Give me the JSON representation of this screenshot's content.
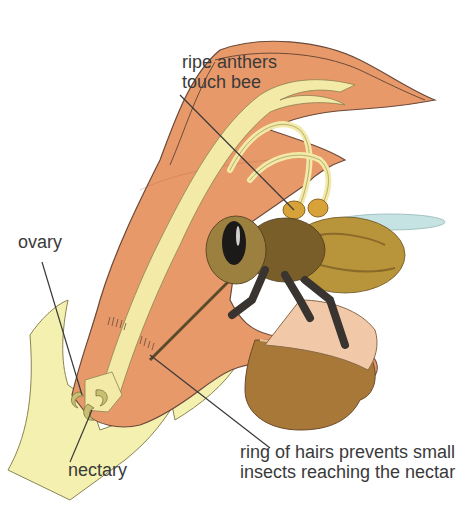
{
  "diagram": {
    "labels": {
      "anthers": {
        "line1": "ripe anthers",
        "line2": "touch bee"
      },
      "ovary": "ovary",
      "nectary": "nectary",
      "hairs": {
        "line1": "ring of hairs prevents small",
        "line2": "insects reaching the nectar"
      }
    },
    "colors": {
      "petal": "#e8996a",
      "petal_light": "#f2b891",
      "outline": "#6b4a3a",
      "stamen": "#f3eaa8",
      "sepal": "#f4f0b0",
      "anther": "#d8a23a",
      "pouch": "#a87838",
      "bee_body": "#8a6a2a",
      "bee_dark": "#2a2420",
      "wing": "#bfe0e0",
      "leader": "#3a3a3a",
      "text": "#3a3a3a"
    }
  }
}
